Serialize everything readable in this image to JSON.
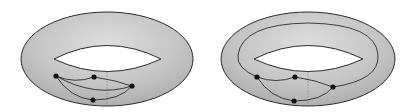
{
  "figure": {
    "colors": {
      "background": "#ffffff",
      "surface_fill": "#b9b9b9",
      "surface_light": "#d9d9d9",
      "outline": "#2b2b2b",
      "vertex": "#111111",
      "dotted": "#8a8a8a"
    }
  },
  "panels": [
    {
      "name": "left-torus",
      "vertices": [
        {
          "id": "A",
          "x": 56,
          "y": 76
        },
        {
          "id": "B",
          "x": 94,
          "y": 77
        },
        {
          "id": "C",
          "x": 132,
          "y": 86
        },
        {
          "id": "D",
          "x": 93,
          "y": 100
        }
      ],
      "edges": [
        [
          "A",
          "B"
        ],
        [
          "A",
          "C"
        ],
        [
          "A",
          "D"
        ],
        [
          "B",
          "C"
        ],
        [
          "D",
          "C"
        ]
      ]
    },
    {
      "name": "right-torus",
      "vertices": [
        {
          "id": "A",
          "x": 257,
          "y": 77
        },
        {
          "id": "B",
          "x": 295,
          "y": 77
        },
        {
          "id": "C",
          "x": 333,
          "y": 87
        },
        {
          "id": "D",
          "x": 294,
          "y": 101
        }
      ],
      "edges": [
        [
          "A",
          "B"
        ],
        [
          "A",
          "D"
        ],
        [
          "B",
          "C"
        ],
        [
          "D",
          "C"
        ],
        [
          "A",
          "C (around torus)"
        ]
      ]
    }
  ]
}
